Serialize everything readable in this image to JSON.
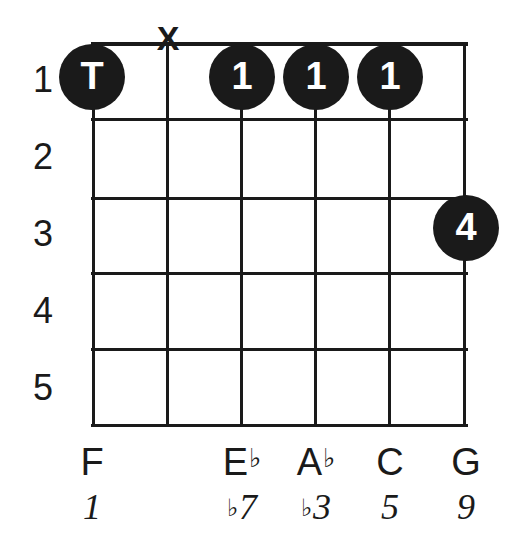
{
  "diagram": {
    "type": "guitar-chord-diagram",
    "strings": 6,
    "frets": 5,
    "ink_color": "#1a1a1a",
    "background_color": "#ffffff",
    "fret_numbers": [
      "1",
      "2",
      "3",
      "4",
      "5"
    ],
    "markers": [
      {
        "id": "thumb-dot",
        "label": "T",
        "string": 1,
        "fret": 1,
        "x": 92,
        "y": 77
      },
      {
        "id": "mute-x",
        "label": "X",
        "string": 2,
        "fret": 0,
        "x": 168,
        "y": 38
      },
      {
        "id": "finger-dot-3",
        "label": "1",
        "string": 3,
        "fret": 1,
        "x": 242,
        "y": 77
      },
      {
        "id": "finger-dot-4",
        "label": "1",
        "string": 4,
        "fret": 1,
        "x": 316,
        "y": 77
      },
      {
        "id": "finger-dot-5",
        "label": "1",
        "string": 5,
        "fret": 1,
        "x": 390,
        "y": 77
      },
      {
        "id": "finger-dot-6",
        "label": "4",
        "string": 6,
        "fret": 3,
        "x": 466,
        "y": 228
      }
    ],
    "string_labels": [
      {
        "note": "F",
        "accidental": "",
        "interval": "1",
        "interval_accidental": "",
        "x": 92
      },
      {
        "note": "",
        "accidental": "",
        "interval": "",
        "interval_accidental": "",
        "x": 168
      },
      {
        "note": "E",
        "accidental": "♭",
        "interval": "7",
        "interval_accidental": "♭",
        "x": 242
      },
      {
        "note": "A",
        "accidental": "♭",
        "interval": "3",
        "interval_accidental": "♭",
        "x": 316
      },
      {
        "note": "C",
        "accidental": "",
        "interval": "5",
        "interval_accidental": "",
        "x": 390
      },
      {
        "note": "G",
        "accidental": "",
        "interval": "9",
        "interval_accidental": "",
        "x": 466
      }
    ]
  },
  "chart_data": {
    "type": "table",
    "title": "",
    "categories": [
      "string 1",
      "string 2",
      "string 3",
      "string 4",
      "string 5",
      "string 6"
    ],
    "series": [
      {
        "name": "fret",
        "values": [
          1,
          null,
          1,
          1,
          1,
          3
        ]
      },
      {
        "name": "finger",
        "values": [
          "T",
          "X",
          "1",
          "1",
          "1",
          "4"
        ]
      },
      {
        "name": "note",
        "values": [
          "F",
          "",
          "E♭",
          "A♭",
          "C",
          "G"
        ]
      },
      {
        "name": "interval",
        "values": [
          "1",
          "",
          "♭7",
          "♭3",
          "5",
          "9"
        ]
      }
    ],
    "xlabel": "string",
    "ylabel": "fret",
    "ylim": [
      1,
      5
    ],
    "grid": true,
    "legend": "none"
  }
}
